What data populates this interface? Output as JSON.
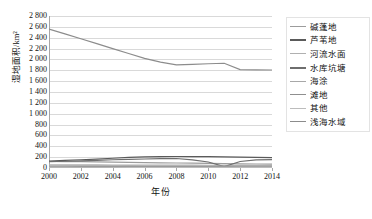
{
  "chart_data": {
    "type": "line",
    "title": "",
    "xlabel": "年份",
    "ylabel": "湿地面积/km²",
    "x": [
      2000,
      2001,
      2002,
      2003,
      2004,
      2005,
      2006,
      2007,
      2008,
      2009,
      2010,
      2011,
      2012,
      2013,
      2014
    ],
    "xtick_labels": [
      "2000",
      "2002",
      "2004",
      "2006",
      "2008",
      "2010",
      "2012",
      "2014"
    ],
    "xticks": [
      2000,
      2002,
      2004,
      2006,
      2008,
      2010,
      2012,
      2014
    ],
    "ytick_labels": [
      "2 800",
      "2 600",
      "2 400",
      "2 200",
      "2 000",
      "1 800",
      "1 600",
      "1 400",
      "1 200",
      "1 000",
      "800",
      "600",
      "400",
      "200",
      "0"
    ],
    "yticks": [
      2800,
      2600,
      2400,
      2200,
      2000,
      1800,
      1600,
      1400,
      1200,
      1000,
      800,
      600,
      400,
      200,
      0
    ],
    "ylim": [
      0,
      2800
    ],
    "xlim": [
      2000,
      2014
    ],
    "grid": "horizontal",
    "legend_position": "right",
    "series": [
      {
        "name": "碱蓬地",
        "color": "#9c9c9c",
        "values": [
          120,
          118,
          116,
          112,
          108,
          104,
          100,
          96,
          92,
          88,
          84,
          80,
          76,
          74,
          72
        ]
      },
      {
        "name": "芦苇地",
        "color": "#5a5a5a",
        "values": [
          128,
          140,
          152,
          165,
          180,
          196,
          205,
          210,
          212,
          210,
          208,
          206,
          200,
          196,
          192
        ]
      },
      {
        "name": "河流水面",
        "color": "#b0b0b0",
        "values": [
          60,
          58,
          57,
          56,
          55,
          54,
          54,
          53,
          52,
          52,
          51,
          50,
          50,
          49,
          48
        ]
      },
      {
        "name": "水库坑塘",
        "color": "#6e6e6e",
        "values": [
          115,
          124,
          133,
          142,
          152,
          160,
          166,
          172,
          175,
          150,
          110,
          25,
          120,
          148,
          156
        ]
      },
      {
        "name": "海涂",
        "color": "#a8a8a8",
        "values": [
          40,
          40,
          39,
          39,
          38,
          38,
          37,
          37,
          36,
          36,
          35,
          35,
          34,
          34,
          33
        ]
      },
      {
        "name": "滩地",
        "color": "#8f8f8f",
        "values": [
          28,
          28,
          27,
          27,
          26,
          26,
          26,
          25,
          25,
          24,
          24,
          24,
          23,
          23,
          22
        ]
      },
      {
        "name": "其他",
        "color": "#bcbcbc",
        "values": [
          15,
          15,
          14,
          14,
          14,
          13,
          13,
          13,
          12,
          12,
          12,
          11,
          11,
          11,
          10
        ]
      },
      {
        "name": "浅海水域",
        "color": "#8c8c8c",
        "values": [
          2560,
          2470,
          2380,
          2290,
          2200,
          2110,
          2020,
          1950,
          1900,
          1910,
          1920,
          1930,
          1812,
          1808,
          1805
        ]
      }
    ]
  }
}
